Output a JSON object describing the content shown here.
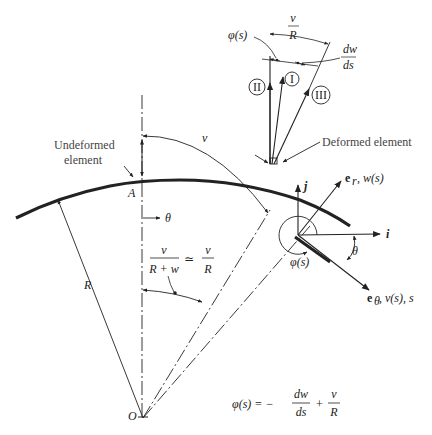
{
  "figure": {
    "labels": {
      "undeformed_1": "Undeformed",
      "undeformed_2": "element",
      "deformed": "Deformed element",
      "point_A": "A",
      "point_O": "O",
      "radius": "R",
      "theta_axis": "θ",
      "arc_v": "v",
      "phi_top": "φ(s)",
      "vR_num": "v",
      "vR_den": "R",
      "dwds_num": "dw",
      "dwds_den": "ds",
      "circle_I": "I",
      "circle_II": "II",
      "circle_III": "III",
      "unit_j": "j",
      "unit_i": "i",
      "er_label": "e",
      "er_sub": "r",
      "er_rest": ", w(s)",
      "etheta_label": "e",
      "etheta_sub": "θ",
      "etheta_rest": " , v(s), s",
      "phi_angle": "φ(s)",
      "theta_angle": "θ",
      "ratio_num": "v",
      "ratio_den": "R + w",
      "approx": "≃",
      "ratio2_num": "v",
      "ratio2_den": "R"
    },
    "equation": {
      "lhs": "φ(s) = −",
      "frac1_num": "dw",
      "frac1_den": "ds",
      "plus": "+",
      "frac2_num": "v",
      "frac2_den": "R"
    },
    "colors": {
      "ink": "#222222",
      "background": "#ffffff"
    }
  }
}
